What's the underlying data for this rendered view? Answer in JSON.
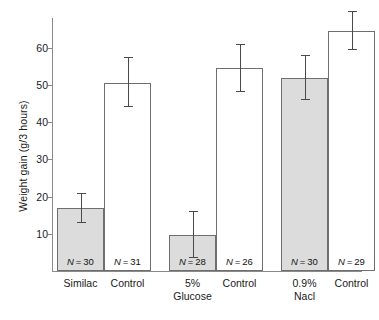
{
  "chart_data": {
    "type": "bar",
    "title": "",
    "xlabel": "",
    "ylabel": "Weight gain (g/3 hours)",
    "ylim": [
      0,
      68
    ],
    "yticks": [
      10,
      20,
      30,
      40,
      50,
      60
    ],
    "ytick_labels": [
      "10",
      "20",
      "30",
      "40",
      "50",
      "60"
    ],
    "grid": false,
    "legend": "none",
    "categories": [
      "Similac",
      "Control",
      "5% Glucose",
      "Control",
      "0.9% Nacl",
      "Control"
    ],
    "group_labels": [
      {
        "line1": "Similac",
        "line2": ""
      },
      {
        "line1": "Control",
        "line2": ""
      },
      {
        "line1": "5%",
        "line2": "Glucose"
      },
      {
        "line1": "Control",
        "line2": ""
      },
      {
        "line1": "0.9%",
        "line2": "Nacl"
      },
      {
        "line1": "Control",
        "line2": ""
      }
    ],
    "values": [
      17.0,
      50.5,
      9.7,
      54.5,
      52.0,
      64.5
    ],
    "err_upper": [
      21.0,
      57.5,
      16.0,
      61.0,
      58.0,
      70.0
    ],
    "err_lower": [
      13.0,
      44.0,
      3.5,
      48.0,
      46.0,
      59.5
    ],
    "n_labels": [
      "N = 30",
      "N = 31",
      "N = 28",
      "N = 26",
      "N = 30",
      "N = 29"
    ],
    "n_values": [
      30,
      31,
      28,
      26,
      30,
      29
    ],
    "fills": [
      "filled",
      "open",
      "filled",
      "open",
      "filled",
      "open"
    ],
    "colors": {
      "filled_bar": "#dcdcdc",
      "open_bar": "#ffffff",
      "bar_border": "#6e6e6e",
      "axis": "#8a8a8a",
      "error_bar": "#4a4a4a",
      "text": "#1a1a1a",
      "background": "#ffffff"
    }
  }
}
